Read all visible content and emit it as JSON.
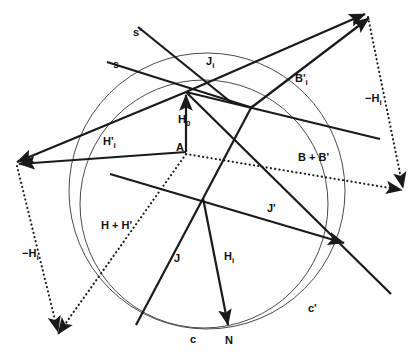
{
  "figure": {
    "background_color": "#fefefe",
    "stroke_color": "#1a1a1a",
    "circle_color": "#4a4a4a",
    "width": 419,
    "height": 359
  },
  "chart_data": {
    "type": "diagram",
    "title": "",
    "xlabel": "",
    "ylabel": "",
    "grid": false,
    "legend": "none",
    "points": [
      {
        "name": "hub",
        "label": "",
        "x": 186,
        "y": 92
      },
      {
        "name": "A",
        "label": "A",
        "x": 186,
        "y": 152
      },
      {
        "name": "N",
        "label": "N",
        "x": 228,
        "y": 327
      },
      {
        "name": "center",
        "label": "",
        "x": 203,
        "y": 198
      },
      {
        "name": "upper-right-apex",
        "label": "",
        "x": 367,
        "y": 15
      },
      {
        "name": "left-apex",
        "label": "",
        "x": 17,
        "y": 163
      },
      {
        "name": "lower-left-apex",
        "label": "",
        "x": 58,
        "y": 334
      },
      {
        "name": "right-lower-apex",
        "label": "",
        "x": 404,
        "y": 190
      },
      {
        "name": "inner-node",
        "label": "",
        "x": 252,
        "y": 107
      },
      {
        "name": "right-node",
        "label": "",
        "x": 345,
        "y": 243
      }
    ],
    "circles": [
      {
        "name": "c-prime",
        "label": "c'",
        "cx": 207,
        "cy": 191,
        "r": 138
      },
      {
        "name": "c",
        "label": "c",
        "cx": 204,
        "cy": 204,
        "r": 124
      }
    ],
    "labels": [
      {
        "id": "s_prime",
        "text": "s'",
        "x": 133,
        "y": 36
      },
      {
        "id": "s",
        "text": "s",
        "x": 113,
        "y": 68
      },
      {
        "id": "J_i",
        "text": "J",
        "sub": "i",
        "x": 206,
        "y": 65
      },
      {
        "id": "B_prime_i",
        "text": "B'",
        "sub": "i",
        "x": 295,
        "y": 82
      },
      {
        "id": "minus_H_i_right",
        "text": "−H",
        "sub": "i",
        "x": 365,
        "y": 102
      },
      {
        "id": "H_0",
        "text": "H",
        "sub": "0",
        "x": 178,
        "y": 123
      },
      {
        "id": "A",
        "text": "A",
        "x": 176,
        "y": 151
      },
      {
        "id": "H_prime_i",
        "text": "H'",
        "sub": "i",
        "x": 103,
        "y": 145
      },
      {
        "id": "B_plus_B_prime",
        "text": "B + B'",
        "x": 298,
        "y": 161
      },
      {
        "id": "J_prime",
        "text": "J'",
        "x": 267,
        "y": 212
      },
      {
        "id": "H_plus_H_prime",
        "text": "H + H'",
        "x": 101,
        "y": 229
      },
      {
        "id": "minus_H_i_left",
        "text": "−H",
        "sub": "i",
        "x": 22,
        "y": 257
      },
      {
        "id": "J",
        "text": "J",
        "x": 174,
        "y": 262
      },
      {
        "id": "H_i",
        "text": "H",
        "sub": "i",
        "x": 224,
        "y": 260
      },
      {
        "id": "c_prime",
        "text": "c'",
        "x": 308,
        "y": 312
      },
      {
        "id": "c",
        "text": "c",
        "x": 190,
        "y": 343
      },
      {
        "id": "N",
        "text": "N",
        "x": 225,
        "y": 344
      }
    ],
    "vectors": [
      {
        "id": "s-prime-ray",
        "label": "s'",
        "style": "solid",
        "arrow": "none",
        "x1": 138,
        "y1": 27,
        "x2": 232,
        "y2": 103
      },
      {
        "id": "s-ray",
        "label": "s",
        "style": "solid",
        "arrow": "none",
        "x1": 107,
        "y1": 62,
        "x2": 253,
        "y2": 108
      },
      {
        "id": "J-i-vector",
        "label": "J_i",
        "style": "solid",
        "arrow": "end",
        "x1": 186,
        "y1": 92,
        "x2": 365,
        "y2": 14
      },
      {
        "id": "B-prime-i-vector",
        "label": "B'_i",
        "style": "solid",
        "arrow": "end",
        "x1": 252,
        "y1": 107,
        "x2": 369,
        "y2": 18
      },
      {
        "id": "minus-H-i-right-dotted",
        "label": "−H_i",
        "style": "dotted",
        "arrow": "end",
        "x1": 368,
        "y1": 17,
        "x2": 403,
        "y2": 188
      },
      {
        "id": "H-0-vector",
        "label": "H_0",
        "style": "solid",
        "arrow": "end",
        "x1": 186,
        "y1": 152,
        "x2": 186,
        "y2": 95
      },
      {
        "id": "H-prime-i-vector",
        "label": "H'_i",
        "style": "solid",
        "arrow": "end",
        "x1": 186,
        "y1": 152,
        "x2": 19,
        "y2": 164
      },
      {
        "id": "hub-to-left-apex",
        "label": "",
        "style": "solid",
        "arrow": "end",
        "x1": 186,
        "y1": 92,
        "x2": 17,
        "y2": 162
      },
      {
        "id": "minus-H-i-left-dotted",
        "label": "−H_i",
        "style": "dotted",
        "arrow": "end",
        "x1": 17,
        "y1": 166,
        "x2": 58,
        "y2": 332
      },
      {
        "id": "B-plus-B-prime-dotted",
        "label": "B + B'",
        "style": "dotted",
        "arrow": "end",
        "x1": 186,
        "y1": 154,
        "x2": 402,
        "y2": 190
      },
      {
        "id": "H-plus-H-prime-dotted",
        "label": "H + H'",
        "style": "dotted",
        "arrow": "end",
        "x1": 186,
        "y1": 154,
        "x2": 58,
        "y2": 334
      },
      {
        "id": "J-prime-vector",
        "label": "J'",
        "style": "solid",
        "arrow": "end",
        "x1": 110,
        "y1": 174,
        "x2": 344,
        "y2": 243
      },
      {
        "id": "J-vector",
        "label": "J",
        "style": "solid",
        "arrow": "none",
        "x1": 136,
        "y1": 325,
        "x2": 252,
        "y2": 106
      },
      {
        "id": "H-i-vector",
        "label": "H_i",
        "style": "solid",
        "arrow": "end",
        "x1": 203,
        "y1": 198,
        "x2": 228,
        "y2": 325
      },
      {
        "id": "long-right-ray",
        "label": "",
        "style": "solid",
        "arrow": "none",
        "x1": 186,
        "y1": 92,
        "x2": 391,
        "y2": 294
      },
      {
        "id": "upper-right-thin-ray",
        "label": "",
        "style": "solid",
        "arrow": "none",
        "x1": 186,
        "y1": 92,
        "x2": 380,
        "y2": 139
      }
    ]
  }
}
